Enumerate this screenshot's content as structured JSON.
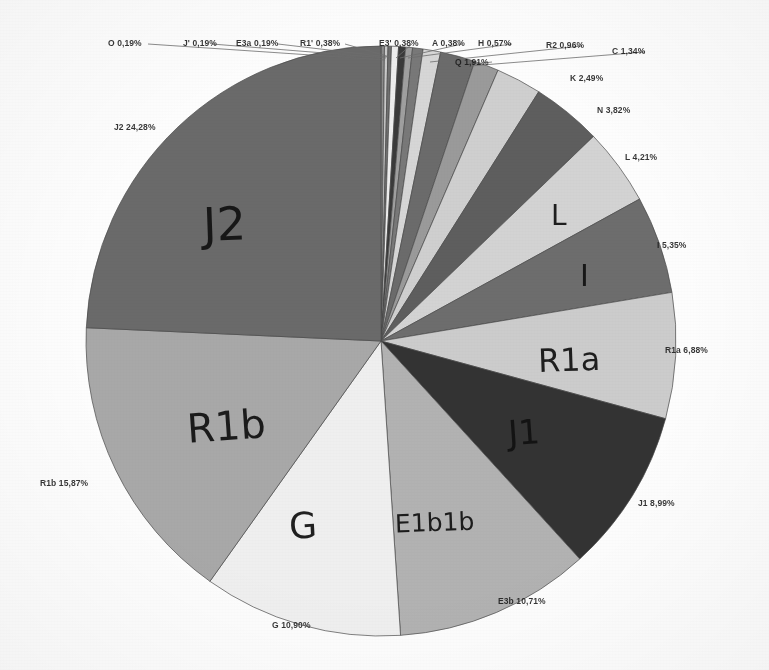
{
  "chart_data": {
    "type": "pie",
    "title": "",
    "subtitle": "",
    "xlabel": "",
    "ylabel": "",
    "legend_position": "none",
    "grid": false,
    "value_unit": "%",
    "decimal_separator": ",",
    "start_angle_deg": 0,
    "direction": "clockwise",
    "categories": [
      "O",
      "J'",
      "E3a",
      "R1'",
      "E3'",
      "A",
      "H",
      "R2",
      "Q",
      "C",
      "K",
      "N",
      "L",
      "I",
      "R1a",
      "J1",
      "E3b",
      "G",
      "R1b",
      "J2"
    ],
    "values": [
      0.19,
      0.19,
      0.19,
      0.38,
      0.38,
      0.38,
      0.57,
      0.96,
      1.91,
      1.34,
      2.49,
      3.82,
      4.21,
      5.35,
      6.88,
      8.99,
      10.71,
      10.9,
      15.87,
      24.28
    ],
    "slices": [
      {
        "id": "slice-o",
        "label": "O",
        "value": 0.19,
        "outer_label": "O 0,19%",
        "color": "#8a8a8a",
        "hand_label": ""
      },
      {
        "id": "slice-jp",
        "label": "J'",
        "value": 0.19,
        "outer_label": "J' 0,19%",
        "color": "#c9c9c9",
        "hand_label": ""
      },
      {
        "id": "slice-e3a",
        "label": "E3a",
        "value": 0.19,
        "outer_label": "E3a 0,19%",
        "color": "#6f6f6f",
        "hand_label": ""
      },
      {
        "id": "slice-r1p",
        "label": "R1'",
        "value": 0.38,
        "outer_label": "R1' 0,38%",
        "color": "#ededed",
        "hand_label": ""
      },
      {
        "id": "slice-e3p",
        "label": "E3'",
        "value": 0.38,
        "outer_label": "E3' 0,38%",
        "color": "#3a3a3a",
        "hand_label": ""
      },
      {
        "id": "slice-a",
        "label": "A",
        "value": 0.38,
        "outer_label": "A 0,38%",
        "color": "#9f9f9f",
        "hand_label": ""
      },
      {
        "id": "slice-h",
        "label": "H",
        "value": 0.57,
        "outer_label": "H 0,57%",
        "color": "#787878",
        "hand_label": ""
      },
      {
        "id": "slice-r2",
        "label": "R2",
        "value": 0.96,
        "outer_label": "R2 0,96%",
        "color": "#d6d6d6",
        "hand_label": ""
      },
      {
        "id": "slice-q",
        "label": "Q",
        "value": 1.91,
        "outer_label": "Q 1,91%",
        "color": "#6b6b6b",
        "hand_label": ""
      },
      {
        "id": "slice-c",
        "label": "C",
        "value": 1.34,
        "outer_label": "C 1,34%",
        "color": "#9a9a9a",
        "hand_label": ""
      },
      {
        "id": "slice-k",
        "label": "K",
        "value": 2.49,
        "outer_label": "K 2,49%",
        "color": "#cfcfcf",
        "hand_label": ""
      },
      {
        "id": "slice-n",
        "label": "N",
        "value": 3.82,
        "outer_label": "N 3,82%",
        "color": "#5e5e5e",
        "hand_label": ""
      },
      {
        "id": "slice-l",
        "label": "L",
        "value": 4.21,
        "outer_label": "L 4,21%",
        "color": "#d3d3d3",
        "hand_label": "L"
      },
      {
        "id": "slice-i",
        "label": "I",
        "value": 5.35,
        "outer_label": "I 5,35%",
        "color": "#6d6d6d",
        "hand_label": "I"
      },
      {
        "id": "slice-r1a",
        "label": "R1a",
        "value": 6.88,
        "outer_label": "R1a 6,88%",
        "color": "#cccccc",
        "hand_label": "R1a"
      },
      {
        "id": "slice-j1",
        "label": "J1",
        "value": 8.99,
        "outer_label": "J1 8,99%",
        "color": "#333333",
        "hand_label": "J1"
      },
      {
        "id": "slice-e3b",
        "label": "E3b",
        "value": 10.71,
        "outer_label": "E3b 10,71%",
        "color": "#b2b2b2",
        "hand_label": "E1b1b"
      },
      {
        "id": "slice-g",
        "label": "G",
        "value": 10.9,
        "outer_label": "G 10,90%",
        "color": "#efefef",
        "hand_label": "G"
      },
      {
        "id": "slice-r1b",
        "label": "R1b",
        "value": 15.87,
        "outer_label": "R1b 15,87%",
        "color": "#a8a8a8",
        "hand_label": "R1b"
      },
      {
        "id": "slice-j2",
        "label": "J2",
        "value": 24.28,
        "outer_label": "J2 24,28%",
        "color": "#6a6a6a",
        "hand_label": "J2"
      }
    ],
    "annotations": [
      {
        "name": "outer-label-o",
        "text": "O 0,19%",
        "x": 108,
        "y": 38
      },
      {
        "name": "outer-label-jp",
        "text": "J' 0,19%",
        "x": 183,
        "y": 38
      },
      {
        "name": "outer-label-e3a",
        "text": "E3a 0,19%",
        "x": 236,
        "y": 38
      },
      {
        "name": "outer-label-r1p",
        "text": "R1' 0,38%",
        "x": 300,
        "y": 38
      },
      {
        "name": "outer-label-e3p",
        "text": "E3' 0,38%",
        "x": 379,
        "y": 38
      },
      {
        "name": "outer-label-a",
        "text": "A 0,38%",
        "x": 432,
        "y": 38
      },
      {
        "name": "outer-label-h",
        "text": "H 0,57%",
        "x": 478,
        "y": 38
      },
      {
        "name": "outer-label-r2",
        "text": "R2 0,96%",
        "x": 546,
        "y": 40
      },
      {
        "name": "outer-label-c",
        "text": "C 1,34%",
        "x": 612,
        "y": 46
      },
      {
        "name": "outer-label-q",
        "text": "Q 1,91%",
        "x": 455,
        "y": 57
      },
      {
        "name": "outer-label-k",
        "text": "K 2,49%",
        "x": 570,
        "y": 73
      },
      {
        "name": "outer-label-n",
        "text": "N 3,82%",
        "x": 597,
        "y": 105
      },
      {
        "name": "outer-label-l",
        "text": "L 4,21%",
        "x": 625,
        "y": 152
      },
      {
        "name": "outer-label-i",
        "text": "I 5,35%",
        "x": 657,
        "y": 240
      },
      {
        "name": "outer-label-r1a",
        "text": "R1a 6,88%",
        "x": 665,
        "y": 345
      },
      {
        "name": "outer-label-j1",
        "text": "J1 8,99%",
        "x": 638,
        "y": 498
      },
      {
        "name": "outer-label-e3b",
        "text": "E3b 10,71%",
        "x": 498,
        "y": 596
      },
      {
        "name": "outer-label-g",
        "text": "G 10,90%",
        "x": 272,
        "y": 620
      },
      {
        "name": "outer-label-r1b",
        "text": "R1b 15,87%",
        "x": 40,
        "y": 478
      },
      {
        "name": "outer-label-j2",
        "text": "J2 24,28%",
        "x": 114,
        "y": 122
      }
    ],
    "hand_annotations": [
      {
        "name": "hand-label-j2",
        "text": "J2",
        "x": 203,
        "y": 197,
        "size": 46,
        "rotate": -2
      },
      {
        "name": "hand-label-r1b",
        "text": "R1b",
        "x": 187,
        "y": 403,
        "size": 40,
        "rotate": -4
      },
      {
        "name": "hand-label-g",
        "text": "G",
        "x": 289,
        "y": 505,
        "size": 36,
        "rotate": -3
      },
      {
        "name": "hand-label-e1b1b",
        "text": "E1b1b",
        "x": 395,
        "y": 508,
        "size": 25,
        "rotate": -2
      },
      {
        "name": "hand-label-j1",
        "text": "J1",
        "x": 508,
        "y": 412,
        "size": 34,
        "rotate": -4
      },
      {
        "name": "hand-label-r1a",
        "text": "R1a",
        "x": 538,
        "y": 341,
        "size": 32,
        "rotate": -2
      },
      {
        "name": "hand-label-i",
        "text": "I",
        "x": 580,
        "y": 258,
        "size": 30,
        "rotate": 0
      },
      {
        "name": "hand-label-l",
        "text": "L",
        "x": 551,
        "y": 199,
        "size": 28,
        "rotate": 0
      }
    ]
  },
  "geometry": {
    "center_x": 381,
    "center_y": 341,
    "radius": 295,
    "start_angle_deg": -90
  }
}
